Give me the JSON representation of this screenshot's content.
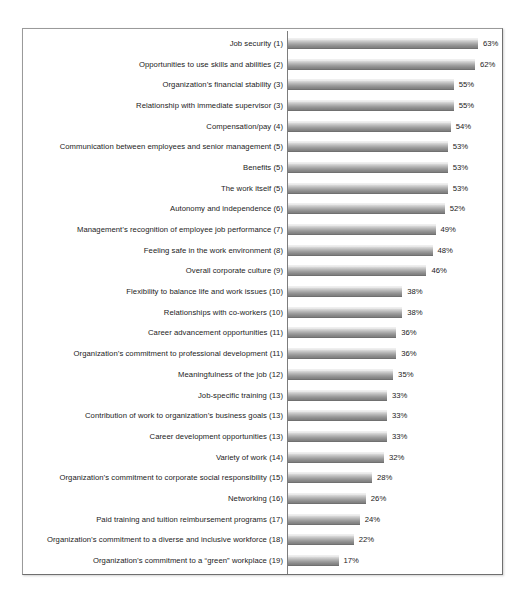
{
  "chart_data": {
    "type": "bar",
    "orientation": "horizontal",
    "title": "",
    "subtitle": "",
    "xlabel": "",
    "ylabel": "",
    "xlim": [
      0,
      63
    ],
    "grid": false,
    "legend": null,
    "value_suffix": "%",
    "categories": [
      "Job security (1)",
      "Opportunities to use skills and abilities (2)",
      "Organization’s financial stability (3)",
      "Relationship with immediate supervisor (3)",
      "Compensation/pay (4)",
      "Communication between employees and senior management (5)",
      "Benefits (5)",
      "The work itself (5)",
      "Autonomy and independence (6)",
      "Management’s recognition of employee job performance (7)",
      "Feeling safe in the work environment (8)",
      "Overall corporate culture (9)",
      "Flexibility to balance life and work issues (10)",
      "Relationships with co-workers (10)",
      "Career advancement opportunities (11)",
      "Organization’s commitment to professional development (11)",
      "Meaningfulness of the job (12)",
      "Job-specific training (13)",
      "Contribution of work to organization’s business goals (13)",
      "Career development opportunities (13)",
      "Variety of work (14)",
      "Organization’s commitment to corporate social responsibility (15)",
      "Networking (16)",
      "Paid training and tuition reimbursement programs (17)",
      "Organization’s commitment to a diverse and inclusive workforce (18)",
      "Organization’s commitment to a “green” workplace (19)"
    ],
    "values": [
      63,
      62,
      55,
      55,
      54,
      53,
      53,
      53,
      52,
      49,
      48,
      46,
      38,
      38,
      36,
      36,
      35,
      33,
      33,
      33,
      32,
      28,
      26,
      24,
      22,
      17
    ],
    "value_labels": [
      "63%",
      "62%",
      "55%",
      "55%",
      "54%",
      "53%",
      "53%",
      "53%",
      "52%",
      "49%",
      "48%",
      "46%",
      "38%",
      "38%",
      "36%",
      "36%",
      "35%",
      "33%",
      "33%",
      "33%",
      "32%",
      "28%",
      "26%",
      "24%",
      "22%",
      "17%"
    ],
    "colors": {
      "bar_top": "#f4f4f4",
      "bar_bottom": "#7e7e7e",
      "axis": "#7d7d7d",
      "frame_border": "#9a9a9a",
      "text": "#1b1b1b",
      "background": "#ffffff"
    }
  }
}
